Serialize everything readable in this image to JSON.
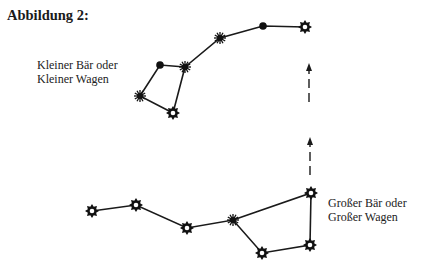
{
  "figure": {
    "title": "Abbildung 2:",
    "labels": {
      "little_dipper_line1": "Kleiner Bär oder",
      "little_dipper_line2": "Kleiner Wagen",
      "big_dipper_line1": "Großer Bär oder",
      "big_dipper_line2": "Großer Wagen"
    },
    "constellations": [
      {
        "name": "Kleiner Bär / Kleiner Wagen",
        "stars": [
          {
            "x": 305,
            "y": 27,
            "symbol": "sun"
          },
          {
            "x": 263,
            "y": 26,
            "symbol": "dot"
          },
          {
            "x": 220,
            "y": 38,
            "symbol": "asterisk"
          },
          {
            "x": 185,
            "y": 67,
            "symbol": "asterisk"
          },
          {
            "x": 160,
            "y": 65,
            "symbol": "dot"
          },
          {
            "x": 140,
            "y": 96,
            "symbol": "asterisk"
          },
          {
            "x": 173,
            "y": 113,
            "symbol": "sun"
          }
        ]
      },
      {
        "name": "Großer Bär / Großer Wagen",
        "stars": [
          {
            "x": 92,
            "y": 211,
            "symbol": "sun"
          },
          {
            "x": 136,
            "y": 205,
            "symbol": "sun"
          },
          {
            "x": 187,
            "y": 228,
            "symbol": "sun"
          },
          {
            "x": 233,
            "y": 220,
            "symbol": "asterisk"
          },
          {
            "x": 262,
            "y": 253,
            "symbol": "sun"
          },
          {
            "x": 310,
            "y": 245,
            "symbol": "sun"
          },
          {
            "x": 311,
            "y": 193,
            "symbol": "sun"
          }
        ]
      }
    ],
    "pointer_arrows": [
      {
        "x": 310,
        "y_start": 175,
        "y_end": 137
      },
      {
        "x": 309,
        "y_start": 102,
        "y_end": 63
      }
    ]
  }
}
